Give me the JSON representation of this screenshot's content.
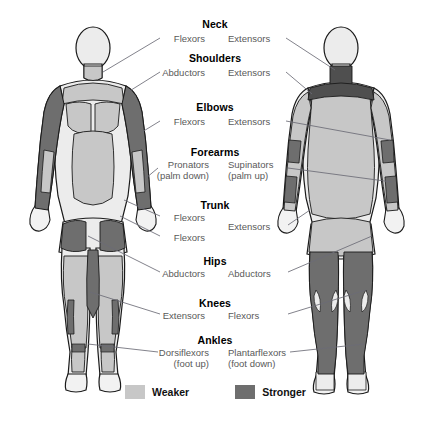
{
  "colors": {
    "weaker": "#c7c7c7",
    "stronger": "#6e6e6e",
    "skin": "#ececec",
    "outline": "#1a1a1a",
    "leader_line": "#6b6b76",
    "heading_text": "#000000",
    "label_text": "#595959",
    "background": "#ffffff"
  },
  "legend": {
    "items": [
      {
        "label": "Weaker",
        "color": "#c7c7c7",
        "name": "legend-weaker"
      },
      {
        "label": "Stronger",
        "color": "#6e6e6e",
        "name": "legend-stronger"
      }
    ]
  },
  "figures": {
    "anterior": {
      "name": "anterior-body-figure"
    },
    "posterior": {
      "name": "posterior-body-figure"
    }
  },
  "joints": [
    {
      "heading": "Neck",
      "heading_x": 215,
      "heading_y": 18,
      "left": {
        "text": "Flexors",
        "sub": "",
        "x": 205,
        "y": 34
      },
      "right": {
        "text": "Extensors",
        "sub": "",
        "x": 228,
        "y": 34
      }
    },
    {
      "heading": "Shoulders",
      "heading_x": 215,
      "heading_y": 52,
      "left": {
        "text": "Abductors",
        "sub": "",
        "x": 205,
        "y": 68
      },
      "right": {
        "text": "Extensors",
        "sub": "",
        "x": 228,
        "y": 68
      }
    },
    {
      "heading": "Elbows",
      "heading_x": 215,
      "heading_y": 101,
      "left": {
        "text": "Flexors",
        "sub": "",
        "x": 205,
        "y": 117
      },
      "right": {
        "text": "Extensors",
        "sub": "",
        "x": 228,
        "y": 117
      }
    },
    {
      "heading": "Forearms",
      "heading_x": 215,
      "heading_y": 146,
      "left": {
        "text": "Pronators",
        "sub": "(palm down)",
        "x": 209,
        "y": 160
      },
      "right": {
        "text": "Supinators",
        "sub": "(palm up)",
        "x": 228,
        "y": 160
      }
    },
    {
      "heading": "Trunk",
      "heading_x": 215,
      "heading_y": 199,
      "left": {
        "text": "Flexors",
        "sub": "",
        "x": 205,
        "y": 213
      },
      "right": {
        "text": "Extensors",
        "sub": "",
        "x": 228,
        "y": 222
      }
    },
    {
      "heading": "Hips",
      "heading_x": 215,
      "heading_y": 255,
      "left": {
        "text": "Abductors",
        "sub": "",
        "x": 205,
        "y": 269
      },
      "right": {
        "text": "Abductors",
        "sub": "",
        "x": 228,
        "y": 269
      }
    },
    {
      "heading": "Knees",
      "heading_x": 215,
      "heading_y": 297,
      "left": {
        "text": "Extensors",
        "sub": "",
        "x": 205,
        "y": 311
      },
      "right": {
        "text": "Flexors",
        "sub": "",
        "x": 228,
        "y": 311
      }
    },
    {
      "heading": "Ankles",
      "heading_x": 215,
      "heading_y": 334,
      "left": {
        "text": "Dorsiflexors",
        "sub": "(foot up)",
        "x": 209,
        "y": 348
      },
      "right": {
        "text": "Plantarflexors",
        "sub": "(foot down)",
        "x": 228,
        "y": 348
      }
    }
  ],
  "extra_labels": [
    {
      "text": "Flexors",
      "x": 205,
      "y": 233,
      "side": "left",
      "name": "trunk-flexors-secondary"
    }
  ]
}
